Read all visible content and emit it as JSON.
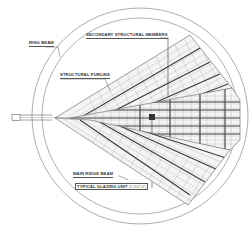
{
  "diagram": {
    "type": "architectural plan - glazed dome / fan roof structure",
    "labels": {
      "ring_beam": "RING BEAM",
      "secondary_members": "SECONDARY STRUCTURAL MEMBERS",
      "structural_purlins": "STRUCTURAL PURLINS",
      "main_ridge_beam": "MAIN RIDGE BEAM",
      "typical_glazing_unit": "TYPICAL GLAZING UNIT",
      "glazing_unit_size": "(5'-0\"x7'-0\")"
    },
    "colors": {
      "line": "#555555",
      "heavy_line": "#3a3a3a",
      "grid": "#9a9a9a",
      "background": "#ffffff"
    }
  }
}
